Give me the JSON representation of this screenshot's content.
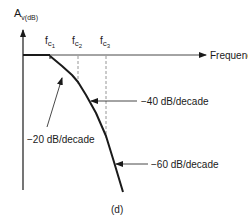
{
  "diagram": {
    "y_axis_label": {
      "main": "A",
      "subscript": "v(dB)"
    },
    "x_axis_label": "Frequency",
    "corner_frequencies": [
      {
        "main": "f",
        "sub1": "c",
        "sub2": "1"
      },
      {
        "main": "f",
        "sub1": "c",
        "sub2": "2"
      },
      {
        "main": "f",
        "sub1": "c",
        "sub2": "3"
      }
    ],
    "slope_labels": [
      "−20 dB/decade",
      "−40 dB/decade",
      "−60 dB/decade"
    ],
    "caption": "(d)",
    "colors": {
      "line": "#1a1a1a",
      "dashed": "#8a8a8a",
      "background": "#ffffff"
    }
  }
}
